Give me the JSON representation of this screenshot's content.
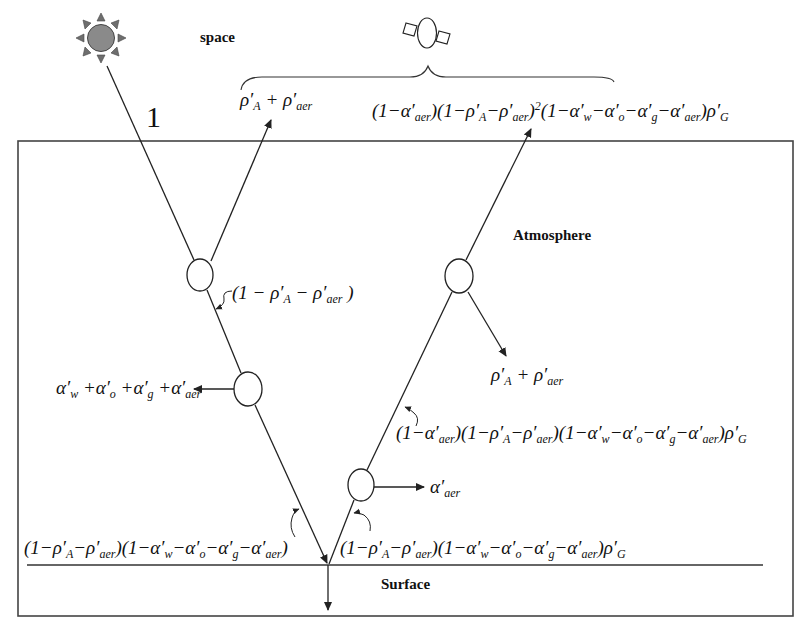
{
  "labels": {
    "space": "space",
    "atmosphere": "Atmosphere",
    "surface": "Surface",
    "incident": "1"
  },
  "icons": {
    "sun": "sun-icon",
    "satellite": "satellite-icon"
  },
  "colors": {
    "line": "#222222",
    "sun_disc": "#8a8a8a",
    "sun_rays": "#6e6e6e",
    "background": "#ffffff"
  },
  "equations": {
    "toa_reflected": "ρ′A + ρ′aer",
    "transmitted_1": "(1 − ρ′A − ρ′aer)",
    "absorbed": "α′w + α′o + α′g + α′aer",
    "surface_incident": "(1−ρ′A−ρ′aer)(1−α′w−α′o−α′g−α′aer)",
    "surface_reflected": "(1−ρ′A−ρ′aer)(1−α′w−α′o−α′g−α′aer)ρ′G",
    "aer_absorbed": "α′aer",
    "after_aer": "(1−α′aer)(1−ρ′A−ρ′aer)(1−α′w−α′o−α′g−α′aer)ρ′G",
    "scattered_down": "ρ′A + ρ′aer",
    "satellite_signal": "(1−α′aer)(1−ρ′A−ρ′aer)²(1−α′w−α′o−α′g−α′aer)ρ′G"
  }
}
